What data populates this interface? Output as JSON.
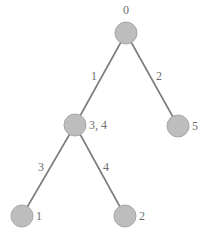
{
  "diagram": {
    "type": "tree",
    "colors": {
      "node_fill": "#bdbdbd",
      "edge": "#7a7a7a",
      "text": "#6e6e6e"
    },
    "nodes": [
      {
        "id": "root",
        "label": "0",
        "label_pos": "above"
      },
      {
        "id": "n34",
        "label": "3, 4",
        "label_pos": "right"
      },
      {
        "id": "n5",
        "label": "5",
        "label_pos": "right"
      },
      {
        "id": "n1",
        "label": "1",
        "label_pos": "right"
      },
      {
        "id": "n2",
        "label": "2",
        "label_pos": "right"
      }
    ],
    "edges": [
      {
        "from": "root",
        "to": "n34",
        "label": "1"
      },
      {
        "from": "root",
        "to": "n5",
        "label": "2"
      },
      {
        "from": "n34",
        "to": "n1",
        "label": "3"
      },
      {
        "from": "n34",
        "to": "n2",
        "label": "4"
      }
    ]
  }
}
